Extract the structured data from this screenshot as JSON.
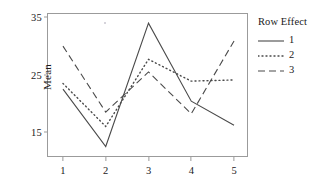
{
  "chart_data": {
    "type": "line",
    "title": "",
    "xlabel": "",
    "ylabel": "Mean",
    "categories": [
      "1",
      "2",
      "3",
      "4",
      "5"
    ],
    "x": [
      1,
      2,
      3,
      4,
      5
    ],
    "xlim": [
      0.65,
      5.35
    ],
    "ylim": [
      10.5,
      35.6
    ],
    "yticks": [
      15,
      25,
      35
    ],
    "ytick_labels": [
      "15",
      "25",
      "35"
    ],
    "xticks": [
      1,
      2,
      3,
      4,
      5
    ],
    "xtick_labels": [
      "1",
      "2",
      "3",
      "4",
      "5"
    ],
    "grid": false,
    "legend": {
      "title": "Row Effect",
      "position": "right",
      "entries": [
        {
          "label": "1",
          "style": "solid"
        },
        {
          "label": "2",
          "style": "dotted"
        },
        {
          "label": "3",
          "style": "dashed"
        }
      ]
    },
    "series": [
      {
        "name": "1",
        "style": "solid",
        "color": "#4a4a4a",
        "values": [
          22.5,
          12.5,
          34.0,
          20.4,
          16.2
        ]
      },
      {
        "name": "2",
        "style": "dotted",
        "color": "#4a4a4a",
        "values": [
          23.5,
          16.0,
          27.7,
          23.9,
          24.1
        ]
      },
      {
        "name": "3",
        "style": "dashed",
        "color": "#4a4a4a",
        "values": [
          30.0,
          18.5,
          25.5,
          18.2,
          30.9
        ]
      }
    ]
  },
  "axes": {
    "y_label": "Mean",
    "y_ticks": [
      "35",
      "25",
      "15"
    ],
    "x_ticks": [
      "1",
      "2",
      "3",
      "4",
      "5"
    ]
  },
  "legend": {
    "title": "Row Effect",
    "items": [
      "1",
      "2",
      "3"
    ]
  },
  "colors": {
    "line": "#4a4a4a",
    "frame": "#9b9b9b",
    "text": "#1a1a1a"
  }
}
